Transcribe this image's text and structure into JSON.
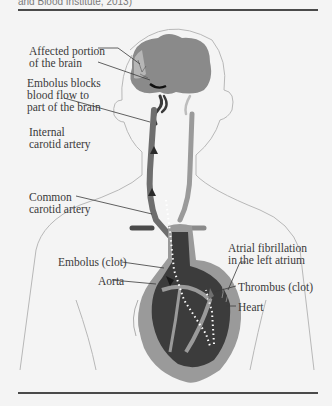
{
  "figure": {
    "caption_tail": "and Blood Institute, 2013)",
    "labels": {
      "affected_portion": [
        "Affected portion",
        "of the brain"
      ],
      "embolus_blocks": [
        "Embolus blocks",
        "blood flow to",
        "part of the brain"
      ],
      "internal_carotid": [
        "Internal",
        "carotid artery"
      ],
      "common_carotid": [
        "Common",
        "carotid artery"
      ],
      "embolus_clot": "Embolus (clot)",
      "aorta": "Aorta",
      "atrial_fibrillation": [
        "Atrial fibrillation",
        "in the left atrium"
      ],
      "thrombus": "Thrombus (clot)",
      "heart": "Heart"
    },
    "colors": {
      "background": "#f4f4f4",
      "brain": "#8c8c8c",
      "artery": "#6e6e6e",
      "heart_dark": "#3c3c3c",
      "heart_wall": "#9a9a9a",
      "outline": "#b0b0b0",
      "clot": "#1e1e1e",
      "rule": "#4a4a4a"
    }
  }
}
